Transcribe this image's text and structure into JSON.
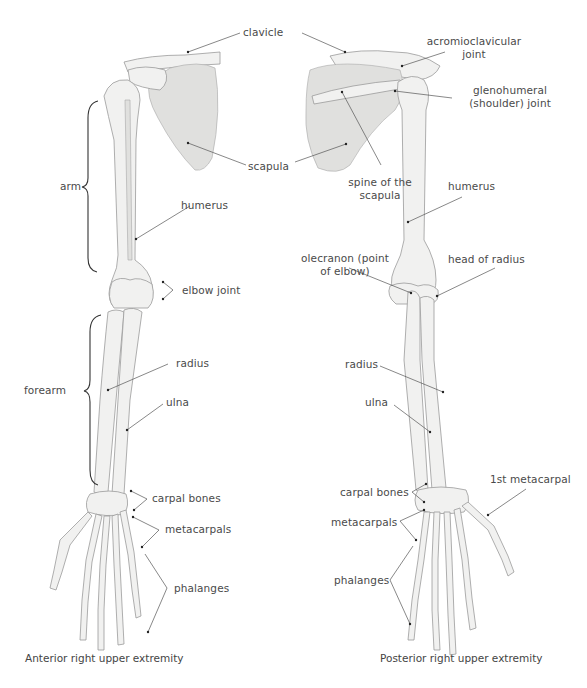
{
  "figure": {
    "left_panel": {
      "caption": "Anterior right upper extremity",
      "labels": {
        "clavicle": "clavicle",
        "scapula": "scapula",
        "arm": "arm",
        "humerus": "humerus",
        "elbow_joint": "elbow joint",
        "forearm": "forearm",
        "radius": "radius",
        "ulna": "ulna",
        "carpal_bones": "carpal bones",
        "metacarpals": "metacarpals",
        "phalanges": "phalanges"
      }
    },
    "right_panel": {
      "caption": "Posterior right upper extremity",
      "labels": {
        "acromioclavicular_joint_1": "acromioclavicular",
        "acromioclavicular_joint_2": "joint",
        "glenohumeral_joint_1": "glenohumeral",
        "glenohumeral_joint_2": "(shoulder) joint",
        "spine_of_scapula_1": "spine of the",
        "spine_of_scapula_2": "scapula",
        "humerus": "humerus",
        "olecranon_1": "olecranon (point",
        "olecranon_2": "of elbow)",
        "head_of_radius": "head of radius",
        "radius": "radius",
        "ulna": "ulna",
        "carpal_bones": "carpal bones",
        "metacarpals": "metacarpals",
        "first_metacarpal": "1st metacarpal",
        "phalanges": "phalanges"
      }
    },
    "colors": {
      "label_text": "#4a4a4a",
      "leader_line": "#555555",
      "bone_fill": "#f1f1f0",
      "bone_stroke": "#9a9a9a",
      "background": "#ffffff"
    }
  }
}
